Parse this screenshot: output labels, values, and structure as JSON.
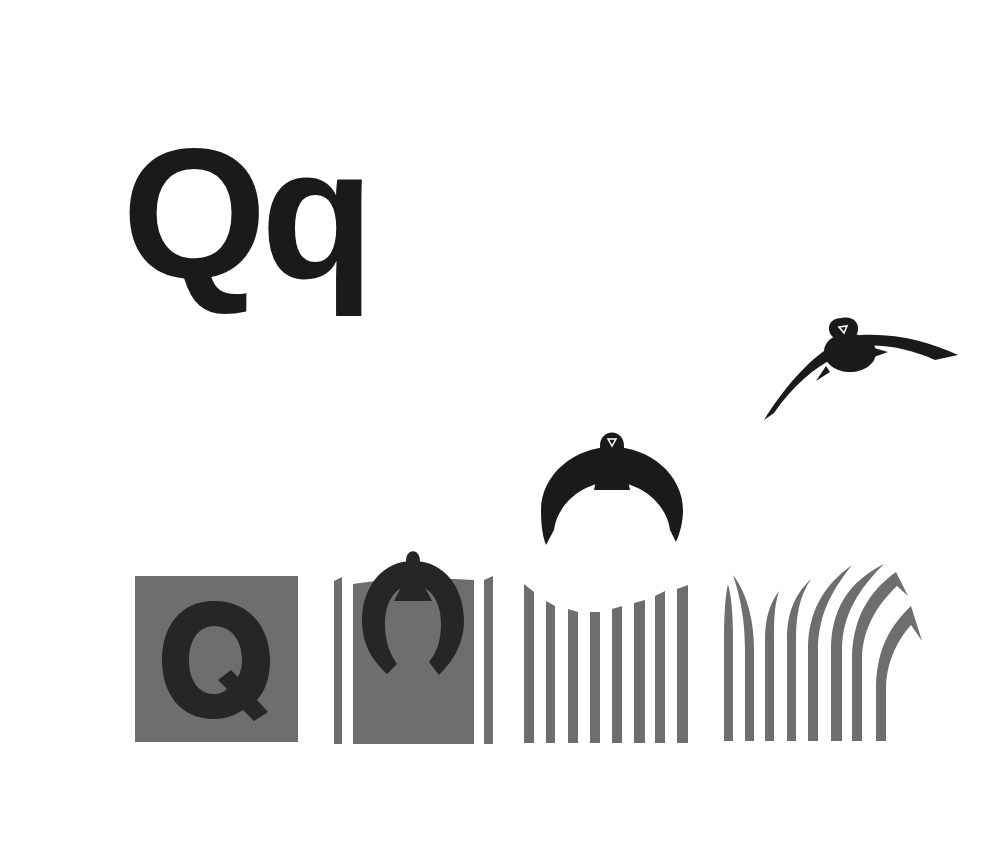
{
  "heading": {
    "text": "Qq"
  },
  "colors": {
    "background": "#ffffff",
    "ink": "#1a1a1a",
    "panel_gray": "#6e6e6e",
    "letter_on_panel": "#262626"
  },
  "sequence": {
    "description": "Letter Q transforms into a flying swallow",
    "stages": [
      {
        "id": 1,
        "label": "Q on gray square"
      },
      {
        "id": 2,
        "label": "Q becomes bird silhouette; square edges split into strips"
      },
      {
        "id": 3,
        "label": "Bird rises with spread wings; square becomes vertical bars"
      },
      {
        "id": 4,
        "label": "Bars bend like grass; bird flies away"
      }
    ]
  }
}
